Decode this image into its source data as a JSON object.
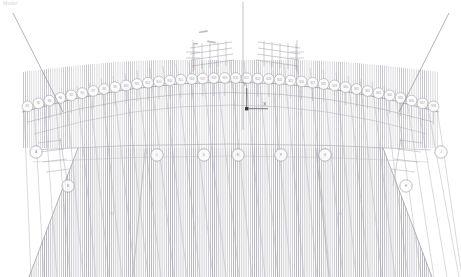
{
  "header": {
    "label": "Model"
  },
  "viewport": {
    "background_color": "#ffffff",
    "line_color": "#8f8f97",
    "hatch_color": "#b9b9c0",
    "accent_color": "#4a4a52"
  },
  "gizmo": {
    "x_label": "X",
    "y_label": "Y",
    "origin_color": "#3a3a42"
  },
  "dome": {
    "rim_nodes": [
      {
        "label": "N1"
      },
      {
        "label": "N2"
      },
      {
        "label": "N3"
      },
      {
        "label": "N4"
      },
      {
        "label": "N5"
      },
      {
        "label": "N6"
      },
      {
        "label": "N7"
      },
      {
        "label": "N8"
      },
      {
        "label": "N9"
      },
      {
        "label": "N10"
      },
      {
        "label": "N11"
      },
      {
        "label": "N12"
      },
      {
        "label": "N13"
      },
      {
        "label": "N14"
      },
      {
        "label": "N15"
      },
      {
        "label": "N16"
      },
      {
        "label": "N17"
      },
      {
        "label": "N18"
      },
      {
        "label": "N19"
      },
      {
        "label": "N20"
      },
      {
        "label": "N21"
      },
      {
        "label": "N22"
      },
      {
        "label": "N23"
      },
      {
        "label": "N24"
      },
      {
        "label": "N25"
      },
      {
        "label": "N26"
      },
      {
        "label": "N27"
      },
      {
        "label": "N28"
      },
      {
        "label": "N29"
      },
      {
        "label": "N30"
      },
      {
        "label": "N31"
      },
      {
        "label": "N32"
      },
      {
        "label": "N33"
      },
      {
        "label": "N34"
      },
      {
        "label": "N35"
      },
      {
        "label": "N36"
      },
      {
        "label": "N37"
      },
      {
        "label": "N38"
      }
    ]
  },
  "callouts": [
    {
      "id": "c1",
      "label": "A",
      "x": 36,
      "y": 152
    },
    {
      "id": "c2",
      "label": "B",
      "x": 68,
      "y": 186
    },
    {
      "id": "c3",
      "label": "C",
      "x": 157,
      "y": 155
    },
    {
      "id": "c4",
      "label": "D",
      "x": 204,
      "y": 155
    },
    {
      "id": "c5",
      "label": "E",
      "x": 238,
      "y": 155
    },
    {
      "id": "c6",
      "label": "F",
      "x": 281,
      "y": 155
    },
    {
      "id": "c7",
      "label": "G",
      "x": 325,
      "y": 155
    },
    {
      "id": "c8",
      "label": "H",
      "x": 406,
      "y": 186
    },
    {
      "id": "c9",
      "label": "J",
      "x": 441,
      "y": 152
    }
  ],
  "edge_tags": [
    {
      "id": "t1",
      "label": "S1",
      "x": 112,
      "y": 215
    },
    {
      "id": "t2",
      "label": "S2",
      "x": 340,
      "y": 215
    }
  ],
  "lattice": {
    "left_label": "P-L",
    "right_label": "P-R"
  }
}
